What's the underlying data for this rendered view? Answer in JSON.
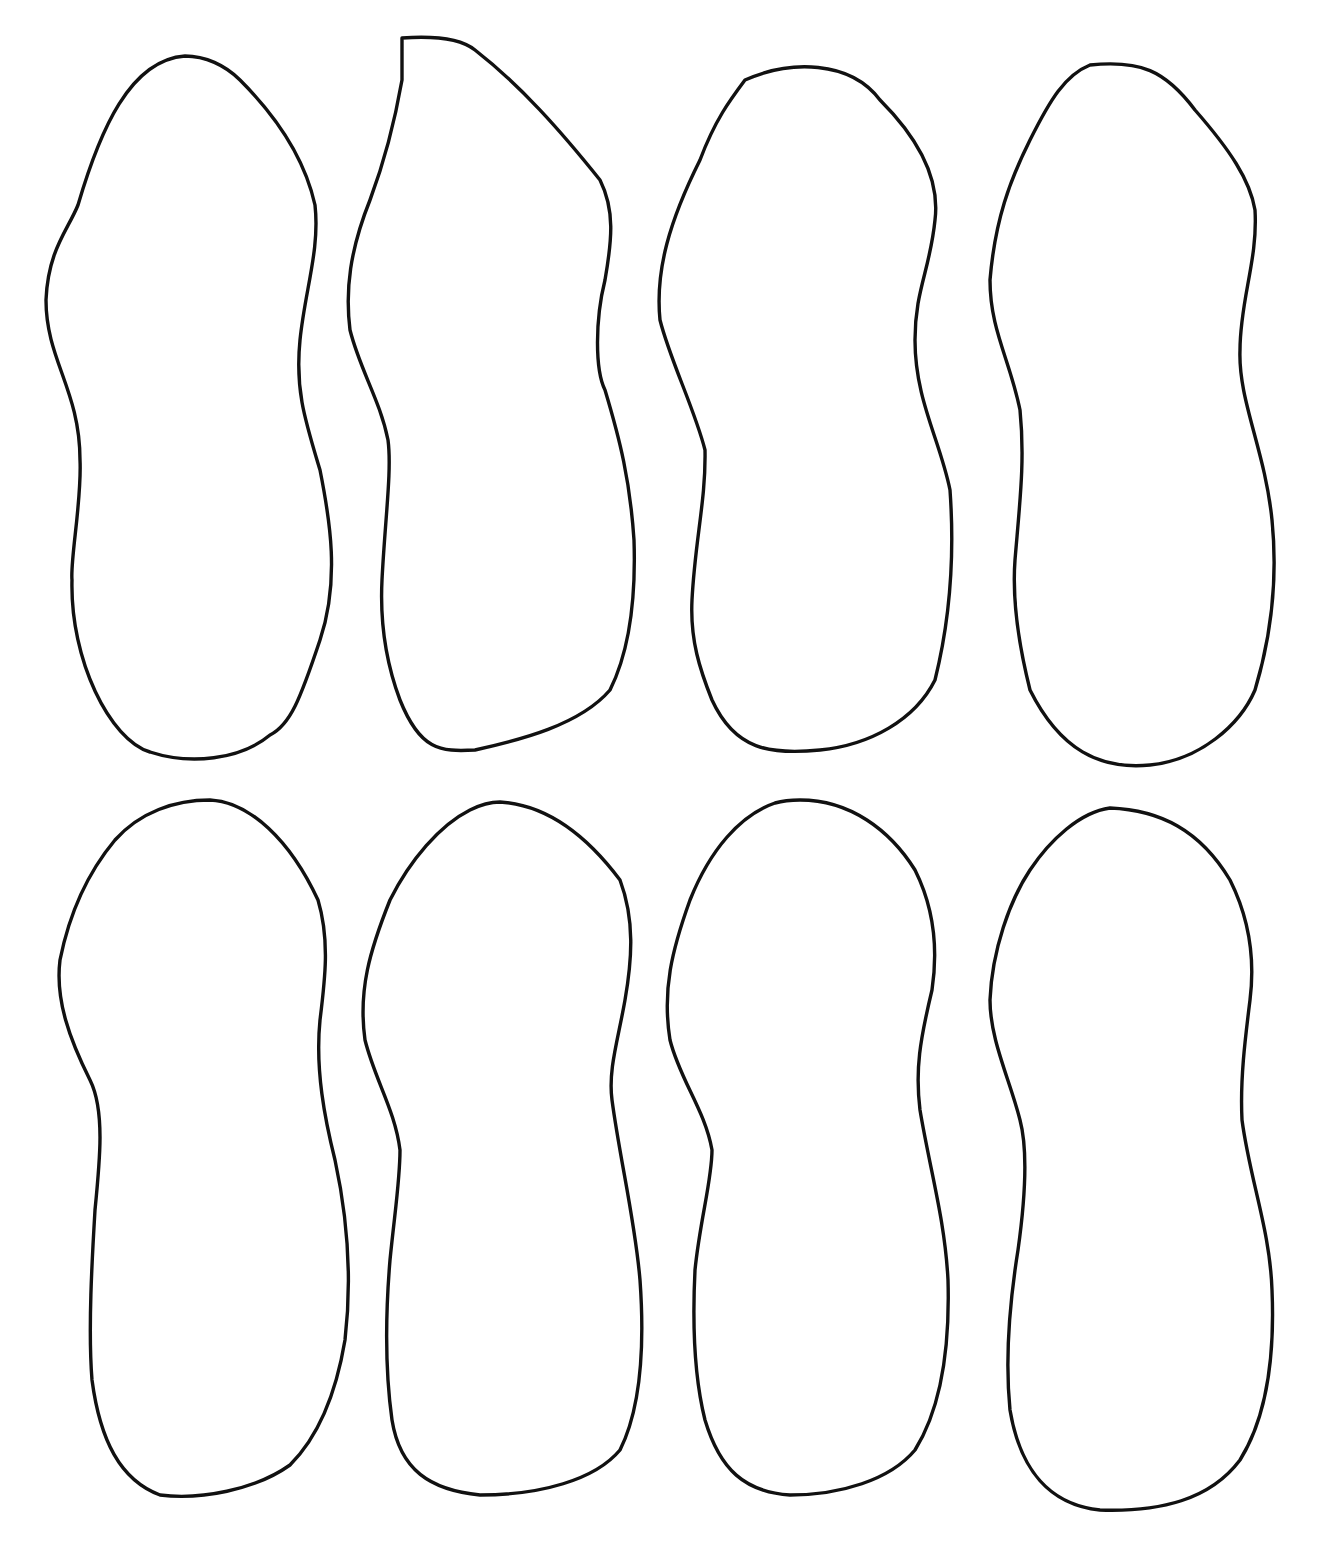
{
  "sheet": {
    "background": "#ffffff",
    "stroke_color": "#111111",
    "layout": {
      "rows": 2,
      "columns": 4
    },
    "shapes": [
      {
        "row": 1,
        "col": 1,
        "type": "peanut-outline",
        "path": "M185,56 C130,60 100,130 78,205 C68,230 48,250 46,300 C46,360 80,390 80,460 C82,500 70,560 72,580 C70,660 110,740 150,752 C190,765 240,760 270,735 C290,725 300,700 320,640 C340,580 330,520 320,470 C305,420 295,390 300,340 C305,290 320,250 315,205 C305,160 280,120 240,80 C225,65 205,56 185,56 Z"
      },
      {
        "row": 1,
        "col": 2,
        "type": "peanut-outline",
        "path": "M402,38 C430,36 460,38 475,50 C520,85 560,130 600,180 C615,210 612,240 605,280 C595,320 595,370 605,390 C620,440 630,480 634,540 C636,600 630,650 610,690 C580,725 520,740 475,750 C440,752 420,750 400,700 C385,660 380,620 382,580 C385,520 392,470 388,440 C380,400 360,370 350,330 C345,290 350,250 370,200 C385,160 395,120 402,80 Z"
      },
      {
        "row": 1,
        "col": 3,
        "type": "peanut-outline",
        "path": "M745,80 C790,60 850,60 880,100 C920,140 940,180 935,220 C930,270 915,290 915,340 C915,400 940,440 950,490 C955,560 950,620 935,680 C915,720 870,745 820,750 C770,755 735,750 712,700 C700,670 690,640 692,600 C695,540 706,500 705,450 C695,410 670,360 660,320 C655,270 670,220 700,160 C715,120 730,100 745,80 Z"
      },
      {
        "row": 1,
        "col": 4,
        "type": "peanut-outline",
        "path": "M1090,65 C1140,60 1165,70 1195,110 C1230,150 1250,180 1255,210 C1258,260 1240,300 1240,350 C1238,400 1265,450 1272,520 C1278,580 1270,640 1255,690 C1240,725 1200,760 1150,765 C1100,770 1060,750 1030,690 C1020,650 1012,600 1015,560 C1020,500 1025,460 1020,410 C1010,360 990,330 990,280 C995,220 1010,180 1030,140 C1050,100 1065,75 1090,65 Z"
      },
      {
        "row": 2,
        "col": 1,
        "type": "peanut-outline",
        "path": "M210,800 C250,802 290,840 318,900 C330,940 325,980 320,1020 C315,1070 325,1120 335,1160 C348,1220 352,1280 345,1340 C335,1400 315,1440 290,1465 C255,1490 200,1500 160,1495 C120,1480 100,1440 92,1380 C88,1330 92,1260 95,1210 C100,1160 105,1110 90,1080 C70,1040 55,1000 60,960 C70,910 90,870 115,840 C140,812 175,800 210,800 Z"
      },
      {
        "row": 2,
        "col": 2,
        "type": "peanut-outline",
        "path": "M500,802 C550,805 590,840 620,880 C635,920 632,960 625,1000 C618,1040 608,1070 612,1100 C620,1160 635,1220 640,1280 C645,1350 640,1410 620,1450 C595,1480 540,1495 480,1495 C430,1490 400,1470 392,1420 C385,1370 385,1320 390,1260 C395,1210 400,1180 400,1150 C395,1110 375,1080 365,1040 C358,990 370,950 390,900 C410,860 440,825 470,810 C480,805 490,802 500,802 Z"
      },
      {
        "row": 2,
        "col": 3,
        "type": "peanut-outline",
        "path": "M800,800 C850,800 890,830 915,870 C935,910 938,950 932,990 C920,1040 915,1070 920,1110 C930,1170 945,1220 948,1280 C950,1350 940,1410 915,1450 C890,1480 840,1495 790,1495 C745,1492 720,1470 705,1420 C695,1380 692,1330 695,1270 C700,1220 712,1180 712,1150 C705,1110 680,1080 670,1040 C662,990 672,950 690,900 C710,850 740,815 775,803 C782,801 790,800 800,800 Z"
      },
      {
        "row": 2,
        "col": 4,
        "type": "peanut-outline",
        "path": "M1110,808 C1160,810 1200,830 1230,880 C1250,920 1255,960 1250,1000 C1245,1040 1240,1080 1242,1120 C1250,1180 1270,1230 1272,1290 C1275,1360 1265,1420 1240,1460 C1210,1500 1160,1512 1100,1510 C1050,1505 1020,1470 1010,1410 C1005,1360 1010,1300 1018,1250 C1025,1200 1028,1150 1020,1120 C1010,1080 990,1040 990,1000 C992,950 1010,900 1030,870 C1050,840 1080,812 1110,808 Z"
      }
    ]
  }
}
